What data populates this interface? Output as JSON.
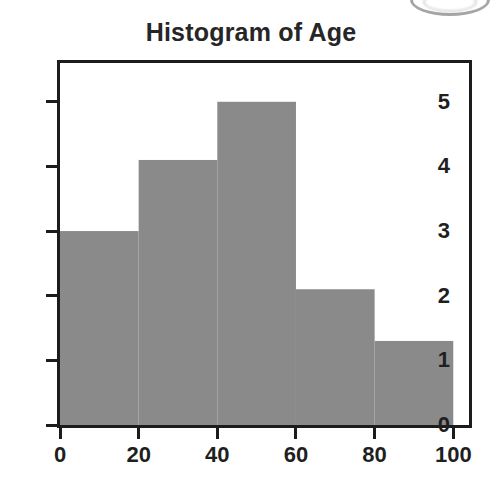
{
  "chart_data": {
    "type": "bar",
    "title": "Histogram of Age",
    "xlabel": "",
    "ylabel": "",
    "bin_width": 20,
    "bin_edges": [
      0,
      20,
      40,
      60,
      80,
      100
    ],
    "categories": [
      "0-20",
      "20-40",
      "40-60",
      "60-80",
      "80-100"
    ],
    "values": [
      3,
      4.1,
      5,
      2.1,
      1.3
    ],
    "xlim": [
      0,
      104
    ],
    "ylim": [
      0,
      5.6
    ],
    "xticks": [
      0,
      20,
      40,
      60,
      80,
      100
    ],
    "xtick_labels": [
      "0",
      "20",
      "40",
      "60",
      "80",
      "100"
    ],
    "yticks": [
      0,
      1,
      2,
      3,
      4,
      5
    ],
    "ytick_labels": [
      "0",
      "1",
      "2",
      "3",
      "4",
      "5"
    ],
    "grid": false,
    "legend": false,
    "bar_fill_color": "#8a8a8a",
    "frame_color": "#1c1c1c",
    "background_color": "#ffffff"
  },
  "figure": {
    "title": "Histogram of Age",
    "artifact_label": "scan-edge-artifact"
  }
}
